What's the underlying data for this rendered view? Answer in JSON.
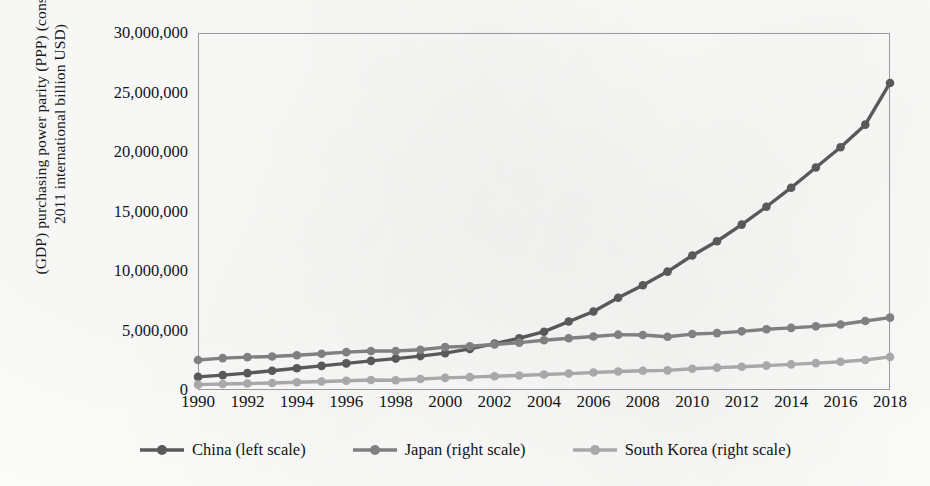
{
  "chart_data": {
    "type": "line",
    "title": "",
    "xlabel": "",
    "ylabel": "(GDP) purchasing power parity (PPP) (constant 2011 international billion USD)",
    "ylabel_line1": "(GDP) purchasing power parity (PPP) (constant",
    "ylabel_line2": "2011 international billion USD)",
    "ylim": [
      0,
      30000000
    ],
    "ytick_labels": [
      "30,000,000",
      "25,000,000",
      "20,000,000",
      "15,000,000",
      "10,000,000",
      "5,000,000",
      "0"
    ],
    "ytick_values": [
      30000000,
      25000000,
      20000000,
      15000000,
      10000000,
      5000000,
      0
    ],
    "xlim": [
      1990,
      2018
    ],
    "xtick_labels": [
      "1990",
      "1992",
      "1994",
      "1996",
      "1998",
      "2000",
      "2002",
      "2004",
      "2006",
      "2008",
      "2010",
      "2012",
      "2014",
      "2016",
      "2018"
    ],
    "x": [
      1990,
      1991,
      1992,
      1993,
      1994,
      1995,
      1996,
      1997,
      1998,
      1999,
      2000,
      2001,
      2002,
      2003,
      2004,
      2005,
      2006,
      2007,
      2008,
      2009,
      2010,
      2011,
      2012,
      2013,
      2014,
      2015,
      2016,
      2017,
      2018
    ],
    "grid": false,
    "legend_position": "bottom",
    "series": [
      {
        "name": "China (left scale)",
        "color": "#595959",
        "marker": "circle",
        "values": [
          1100000,
          1250000,
          1420000,
          1620000,
          1830000,
          2030000,
          2240000,
          2450000,
          2640000,
          2850000,
          3100000,
          3380000,
          3720000,
          4120000,
          4620000,
          5250000,
          6000000,
          6900000,
          7850000,
          8750000,
          9900000,
          11100000,
          12300000,
          13600000,
          15100000,
          16700000,
          18400000,
          20300000,
          22200000
        ]
      },
      {
        "name": "Japan (right scale)",
        "color": "#808080",
        "marker": "circle",
        "values": [
          2520000,
          2620000,
          2660000,
          2680000,
          2750000,
          2830000,
          2920000,
          2960000,
          2920000,
          2940000,
          3030000,
          3050000,
          3080000,
          3140000,
          3230000,
          3300000,
          3360000,
          3430000,
          3410000,
          3230000,
          3380000,
          3390000,
          3450000,
          3530000,
          3540000,
          3590000,
          3620000,
          3690000,
          3700000
        ]
      },
      {
        "name": "South Korea (right scale)",
        "color": "#a8a8a8",
        "marker": "circle",
        "values": [
          450000,
          490000,
          520000,
          560000,
          610000,
          670000,
          710000,
          750000,
          710000,
          790000,
          860000,
          900000,
          970000,
          1000000,
          1050000,
          1100000,
          1160000,
          1220000,
          1250000,
          1260000,
          1350000,
          1400000,
          1430000,
          1470000,
          1520000,
          1570000,
          1620000,
          1680000,
          1720000
        ]
      }
    ],
    "series_plotted": [
      {
        "name": "China (left scale)",
        "color": "#595959",
        "plot_values": [
          1100000,
          1250000,
          1420000,
          1620000,
          1830000,
          2030000,
          2240000,
          2450000,
          2640000,
          2850000,
          3100000,
          3450000,
          3900000,
          4350000,
          4900000,
          5750000,
          6600000,
          7750000,
          8800000,
          9950000,
          11300000,
          12500000,
          13900000,
          15400000,
          17000000,
          18700000,
          20400000,
          22300000,
          25800000
        ]
      },
      {
        "name": "Japan (right scale)",
        "color": "#808080",
        "plot_values": [
          2520000,
          2680000,
          2760000,
          2820000,
          2920000,
          3050000,
          3180000,
          3280000,
          3280000,
          3380000,
          3600000,
          3680000,
          3820000,
          3980000,
          4180000,
          4350000,
          4500000,
          4650000,
          4620000,
          4480000,
          4700000,
          4780000,
          4930000,
          5100000,
          5220000,
          5350000,
          5500000,
          5800000,
          6080000
        ]
      },
      {
        "name": "South Korea (right scale)",
        "color": "#a8a8a8",
        "plot_values": [
          450000,
          500000,
          540000,
          590000,
          650000,
          720000,
          780000,
          840000,
          820000,
          920000,
          1020000,
          1080000,
          1160000,
          1220000,
          1300000,
          1380000,
          1470000,
          1560000,
          1620000,
          1650000,
          1790000,
          1880000,
          1960000,
          2050000,
          2150000,
          2260000,
          2380000,
          2520000,
          2780000
        ]
      }
    ]
  },
  "legend": {
    "items": [
      {
        "label": "China (left scale)",
        "color": "#595959"
      },
      {
        "label": "Japan (right scale)",
        "color": "#808080"
      },
      {
        "label": "South Korea (right scale)",
        "color": "#a8a8a8"
      }
    ]
  }
}
